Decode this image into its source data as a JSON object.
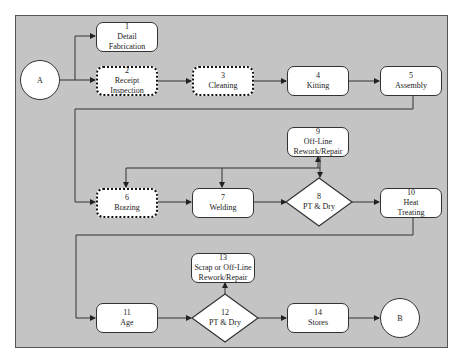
{
  "diagram": {
    "type": "process-flowchart",
    "connectors": {
      "start": "A",
      "end": "B"
    },
    "nodes": [
      {
        "id": "1",
        "label": "Detail Fabrication",
        "line1": "Detail",
        "line2": "Fabrication",
        "shape": "rounded-rect",
        "border": "solid"
      },
      {
        "id": "2",
        "label": "Receipt Inspection",
        "line1": "Receipt",
        "line2": "Inspection",
        "shape": "rounded-rect",
        "border": "dashed"
      },
      {
        "id": "3",
        "label": "Cleaning",
        "line1": "Cleaning",
        "shape": "rounded-rect",
        "border": "dashed"
      },
      {
        "id": "4",
        "label": "Kitting",
        "line1": "Kitting",
        "shape": "rounded-rect",
        "border": "solid"
      },
      {
        "id": "5",
        "label": "Assembly",
        "line1": "Assembly",
        "shape": "rounded-rect",
        "border": "solid"
      },
      {
        "id": "6",
        "label": "Brazing",
        "line1": "Brazing",
        "shape": "rounded-rect",
        "border": "dashed"
      },
      {
        "id": "7",
        "label": "Welding",
        "line1": "Welding",
        "shape": "rounded-rect",
        "border": "solid"
      },
      {
        "id": "8",
        "label": "PT & Dry",
        "line1": "PT & Dry",
        "shape": "diamond"
      },
      {
        "id": "9",
        "label": "Off-Line Rework/Repair",
        "line1": "Off-Line",
        "line2": "Rework/Repair",
        "shape": "rounded-rect",
        "border": "solid"
      },
      {
        "id": "10",
        "label": "Heat Treating",
        "line1": "Heat",
        "line2": "Treating",
        "shape": "rounded-rect",
        "border": "solid"
      },
      {
        "id": "11",
        "label": "Age",
        "line1": "Age",
        "shape": "rounded-rect",
        "border": "solid"
      },
      {
        "id": "12",
        "label": "PT & Dry",
        "line1": "PT & Dry",
        "shape": "diamond"
      },
      {
        "id": "13",
        "label": "Scrap or Off-Line Rework/Repair",
        "line1": "Scrap or Off-Line",
        "line2": "Rework/Repair",
        "shape": "rounded-rect",
        "border": "solid"
      },
      {
        "id": "14",
        "label": "Stores",
        "line1": "Stores",
        "shape": "rounded-rect",
        "border": "solid"
      }
    ],
    "edges": [
      [
        "A",
        "1"
      ],
      [
        "A",
        "2"
      ],
      [
        "2",
        "3"
      ],
      [
        "3",
        "4"
      ],
      [
        "4",
        "5"
      ],
      [
        "5",
        "6"
      ],
      [
        "6",
        "7"
      ],
      [
        "7",
        "8"
      ],
      [
        "8",
        "9"
      ],
      [
        "9",
        "8"
      ],
      [
        "8",
        "6"
      ],
      [
        "8",
        "7"
      ],
      [
        "8",
        "10"
      ],
      [
        "10",
        "11"
      ],
      [
        "11",
        "12"
      ],
      [
        "12",
        "13"
      ],
      [
        "12",
        "14"
      ],
      [
        "14",
        "B"
      ]
    ]
  }
}
